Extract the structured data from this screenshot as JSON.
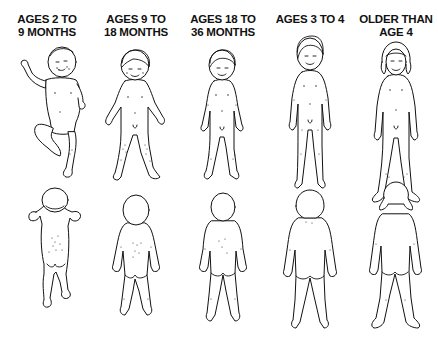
{
  "columns": [
    {
      "heading_line1": "AGES 2 TO",
      "heading_line2": "9 MONTHS",
      "center_x": 47
    },
    {
      "heading_line1": "AGES 9 TO",
      "heading_line2": "18 MONTHS",
      "center_x": 136
    },
    {
      "heading_line1": "AGES 18 TO",
      "heading_line2": "36 MONTHS",
      "center_x": 223
    },
    {
      "heading_line1": "AGES 3 TO 4",
      "heading_line2": "",
      "center_x": 310
    },
    {
      "heading_line1": "OLDER THAN",
      "heading_line2": "AGE 4",
      "center_x": 396
    }
  ],
  "rows": [
    "front-view",
    "back-view"
  ],
  "colors": {
    "line": "#111111",
    "background": "#ffffff",
    "stipple": "#333333"
  }
}
